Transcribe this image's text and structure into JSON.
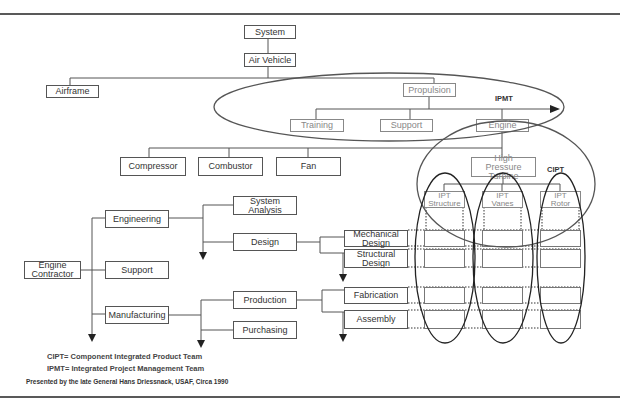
{
  "diagram": {
    "type": "organizational-breakdown",
    "top_tree": {
      "system": "System",
      "air_vehicle": "Air Vehicle",
      "airframe": "Airframe",
      "propulsion": "Propulsion",
      "training": "Training",
      "support": "Support",
      "engine": "Engine",
      "compressor": "Compressor",
      "combustor": "Combustor",
      "fan": "Fan",
      "high_pressure_turbine": "High Pressure Turbine"
    },
    "teams": {
      "ipmt_label": "IPMT",
      "cipt_label": "CIPT",
      "ipt_structure": "IPT Structure",
      "ipt_vanes": "IPT Vanes",
      "ipt_rotor": "IPT Rotor"
    },
    "contractor_tree": {
      "engine_contractor": "Engine Contractor",
      "engineering": "Engineering",
      "support": "Support",
      "manufacturing": "Manufacturing",
      "system_analysis": "System Analysis",
      "design": "Design",
      "production": "Production",
      "purchasing": "Purchasing",
      "mechanical_design": "Mechanical Design",
      "structural_design": "Structural Design",
      "fabrication": "Fabrication",
      "assembly": "Assembly"
    },
    "legend": {
      "cipt": "CIPT=  Component Integrated Product Team",
      "ipmt": "IPMT=  Integrated Project Management Team"
    },
    "credit": "Presented by the late General Hans Driessnack, USAF,  Circa 1990"
  }
}
